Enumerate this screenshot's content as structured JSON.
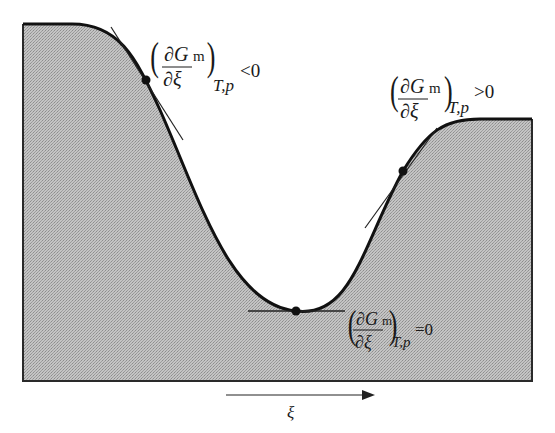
{
  "figure": {
    "x_axis_label": "ξ",
    "fill_color": "#b9b9b9",
    "line_color": "#111111",
    "annotations": [
      {
        "id": "negative-slope",
        "numerator": "∂G",
        "subscript_m": "m",
        "denominator": "∂ξ",
        "conditions": "T,p",
        "relation": "<0"
      },
      {
        "id": "positive-slope",
        "numerator": "∂G",
        "subscript_m": "m",
        "denominator": "∂ξ",
        "conditions": "T,p",
        "relation": ">0"
      },
      {
        "id": "zero-slope",
        "numerator": "∂G",
        "subscript_m": "m",
        "denominator": "∂ξ",
        "conditions": "T,p",
        "relation": "=0"
      }
    ]
  }
}
